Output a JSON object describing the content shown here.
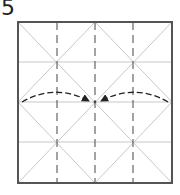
{
  "step": {
    "number": "5"
  },
  "diagram": {
    "type": "origami-fold-step",
    "square": {
      "x": 18,
      "y": 22,
      "width": 154,
      "height": 161
    },
    "colors": {
      "border": "#555555",
      "crease": "#c8c8c8",
      "valley_fold": "#666666",
      "arrow": "#222222"
    },
    "valley_folds_vertical_x": [
      57,
      133
    ],
    "creases_horizontal_y": [
      62,
      102,
      142
    ],
    "crease_vertical_x": [
      95
    ],
    "arrows": [
      {
        "name": "left-fold-arrow",
        "from": [
          22,
          102
        ],
        "to": [
          89,
          101
        ]
      },
      {
        "name": "right-fold-arrow",
        "from": [
          168,
          102
        ],
        "to": [
          101,
          101
        ]
      }
    ]
  }
}
